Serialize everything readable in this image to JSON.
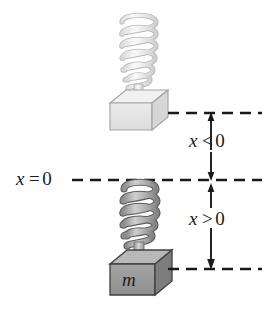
{
  "figure": {
    "background_color": "#ffffff",
    "width": 264,
    "height": 317
  },
  "labels": {
    "x_equals_zero": {
      "variable": "x",
      "operator": "=",
      "value": "0"
    },
    "x_less_than_zero": {
      "variable": "x",
      "operator": "<",
      "value": "0"
    },
    "x_greater_than_zero": {
      "variable": "x",
      "operator": ">",
      "value": "0"
    },
    "mass": "m"
  },
  "reference_lines": [
    {
      "name": "upper-dashed-line",
      "y": 113,
      "x_start": 168,
      "x_end": 262,
      "label": "x < 0 position"
    },
    {
      "name": "equilibrium-dashed-line",
      "y": 180,
      "x_start": 72,
      "x_end": 262,
      "label": "x = 0"
    },
    {
      "name": "lower-dashed-line",
      "y": 269,
      "x_start": 168,
      "x_end": 262,
      "label": "x > 0 position"
    }
  ],
  "arrows": [
    {
      "name": "x-less-than-zero-arrow",
      "x": 211,
      "y_top": 114,
      "y_bottom": 179,
      "double_headed": true
    },
    {
      "name": "x-greater-than-zero-arrow",
      "x": 211,
      "y_top": 181,
      "y_bottom": 268,
      "double_headed": true
    }
  ],
  "springs": [
    {
      "name": "upper-spring",
      "state": "stretched",
      "coils": 6,
      "color": "#e9e9e9",
      "outline_color": "#b4b4b4",
      "x_center": 138,
      "y_top": 16,
      "y_bottom": 88
    },
    {
      "name": "lower-spring",
      "state": "compressed",
      "coils": 5,
      "color": "#a8a8a8",
      "outline_color": "#5f5f5f",
      "x_center": 139,
      "y_top": 183,
      "y_bottom": 248
    }
  ],
  "blocks": [
    {
      "name": "upper-block",
      "fill_top": "#efefef",
      "fill_front": "#e4e4e4",
      "fill_side": "#d2d2d2",
      "outline": "#9a9a9a",
      "label": "",
      "x": 110,
      "y": 90,
      "width": 58,
      "height": 40
    },
    {
      "name": "lower-block",
      "fill_top": "#b5b5b5",
      "fill_front": "#9a9a9a",
      "fill_side": "#7a7a7a",
      "outline": "#4a4a4a",
      "label": "m",
      "x": 110,
      "y": 250,
      "width": 62,
      "height": 45
    }
  ],
  "colors": {
    "line": "#1a1a1a",
    "text": "#1a1a1a",
    "background": "#ffffff",
    "light_gray": "#e4e4e4",
    "mid_gray": "#9a9a9a",
    "dark_gray": "#5f5f5f"
  }
}
